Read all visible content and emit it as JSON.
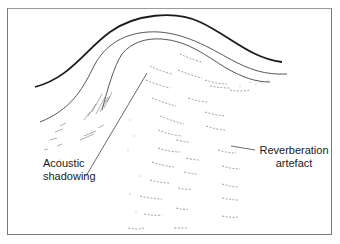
{
  "figure": {
    "type": "ultrasound-schematic",
    "colors": {
      "line": "#1a1a1a",
      "thin_line": "#555555",
      "speckle": "#888888",
      "frame": "#7a7a7a",
      "background": "#ffffff"
    },
    "labels": {
      "acoustic_shadowing": {
        "line1": "Acoustic",
        "line2": "shadowing"
      },
      "reverberation_artefact": {
        "line1": "Reverberation",
        "line2": "artefact"
      }
    }
  }
}
